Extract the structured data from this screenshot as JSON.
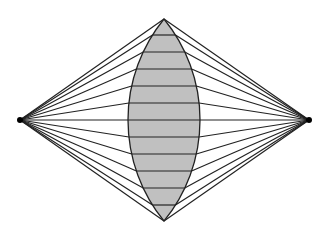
{
  "diagram": {
    "title": "",
    "left_point": {
      "x": 20,
      "y": 120
    },
    "right_point": {
      "x": 309,
      "y": 120
    },
    "lens": {
      "top": {
        "x": 164,
        "y": 19
      },
      "bottom": {
        "x": 164,
        "y": 221
      },
      "half_width": 36,
      "fill": "#c0c0c0",
      "stroke": "#222222"
    },
    "chord_ys": [
      35,
      52,
      69,
      86,
      103,
      120,
      137,
      154,
      171,
      188,
      205
    ],
    "line_color": "#222222",
    "dot_color": "#000000"
  }
}
